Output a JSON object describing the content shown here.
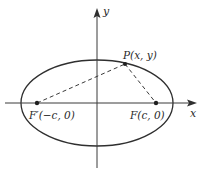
{
  "diagram": {
    "type": "ellipse-foci",
    "colors": {
      "stroke": "#2f2f2f",
      "axis": "#3a3a3a",
      "text": "#2a2a2a",
      "background": "#ffffff"
    },
    "axes": {
      "x_label": "x",
      "y_label": "y"
    },
    "points": {
      "P": {
        "label": "P(x, y)"
      },
      "F": {
        "label": "F(c, 0)"
      },
      "F_prime": {
        "label": "F′(−c, 0)"
      }
    },
    "segments": [
      {
        "from": "F_prime",
        "to": "P",
        "style": "dashed"
      },
      {
        "from": "P",
        "to": "F",
        "style": "dashed"
      }
    ]
  }
}
